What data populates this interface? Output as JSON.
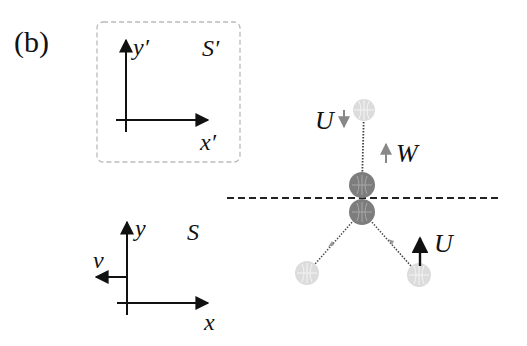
{
  "panel_label": "(b)",
  "frame_prime": {
    "name": "S′",
    "x_axis": "x′",
    "y_axis": "y′"
  },
  "frame_lab": {
    "name": "S",
    "x_axis": "x",
    "y_axis": "y",
    "velocity": "v"
  },
  "collision": {
    "incoming_velocity": "U",
    "recoil_velocity": "W",
    "outgoing_velocity": "U"
  },
  "colors": {
    "axis": "#111111",
    "box_border": "#bbbbbb",
    "ball_dark": "#7a7a7a",
    "ball_light": "#d9d9d9",
    "arrow_gray": "#888888"
  }
}
